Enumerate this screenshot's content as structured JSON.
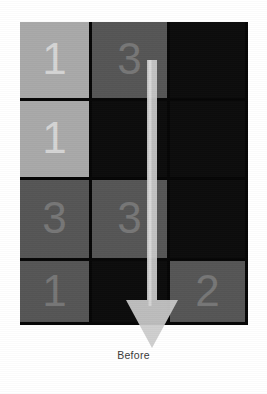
{
  "figure": {
    "caption": "Before",
    "grid": {
      "rows": 4,
      "cols": 3,
      "cells": [
        [
          {
            "value": "1",
            "shade": "light"
          },
          {
            "value": "3",
            "shade": "mid"
          },
          {
            "value": "",
            "shade": "dark"
          }
        ],
        [
          {
            "value": "1",
            "shade": "light"
          },
          {
            "value": "",
            "shade": "dark"
          },
          {
            "value": "",
            "shade": "dark"
          }
        ],
        [
          {
            "value": "3",
            "shade": "mid"
          },
          {
            "value": "3",
            "shade": "mid"
          },
          {
            "value": "",
            "shade": "dark"
          }
        ],
        [
          {
            "value": "1",
            "shade": "mid"
          },
          {
            "value": "",
            "shade": "dark"
          },
          {
            "value": "2",
            "shade": "mid"
          }
        ]
      ]
    },
    "annotation": {
      "arrow_icon": "arrow-down-icon",
      "direction": "down",
      "column": 2,
      "from_row": 1,
      "to_row": 4,
      "color": "#cfcfcf"
    },
    "colors": {
      "board_background": "#050505",
      "tile_light": "#a9a9a9",
      "tile_mid": "#565656",
      "tile_dark": "#0c0c0c",
      "digit_light": "#d5d5d5",
      "digit_mid": "#777777",
      "page_background": "#ffffff",
      "caption_color": "#3a3a3a"
    }
  }
}
